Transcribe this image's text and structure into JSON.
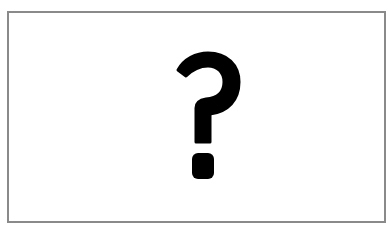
{
  "placeholder": {
    "icon": "question-mark-icon",
    "glyph": "?",
    "color": "#000000",
    "border_color": "#8a8a8a",
    "background": "#ffffff"
  }
}
